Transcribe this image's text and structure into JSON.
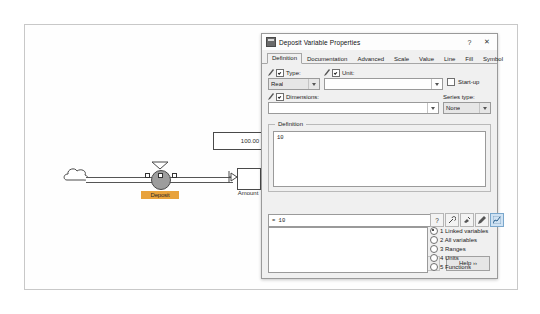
{
  "diagram": {
    "source_icon": "cloud-icon",
    "flow_label": "Deposit",
    "stock_label": "Amount",
    "readout_value": "100.00"
  },
  "dialog": {
    "title": "Deposit Variable Properties",
    "titlebar": {
      "help_label": "?",
      "close_label": "✕"
    },
    "tabs": [
      {
        "label": "Definition",
        "active": true
      },
      {
        "label": "Documentation",
        "active": false
      },
      {
        "label": "Advanced",
        "active": false
      },
      {
        "label": "Scale",
        "active": false
      },
      {
        "label": "Value",
        "active": false
      },
      {
        "label": "Line",
        "active": false
      },
      {
        "label": "Fill",
        "active": false
      },
      {
        "label": "Symbol",
        "active": false
      }
    ],
    "type": {
      "label": "Type:",
      "value": "Real",
      "checked": true
    },
    "unit": {
      "label": "Unit:",
      "value": "",
      "checked": true
    },
    "dimensions": {
      "label": "Dimensions:",
      "value": "",
      "checked": true
    },
    "startup": {
      "label": "Start-up",
      "checked": false
    },
    "series_type": {
      "label": "Series type:",
      "value": "None"
    },
    "definition": {
      "group_label": "Definition",
      "text": "10"
    },
    "status": {
      "value": "= 10"
    },
    "toolbar_icons": [
      "question-icon",
      "wrench-icon",
      "paint-icon",
      "pencil-icon",
      "graph-icon"
    ],
    "browser_options": [
      {
        "label": "1 Linked variables",
        "selected": true
      },
      {
        "label": "2 All variables",
        "selected": false
      },
      {
        "label": "3 Ranges",
        "selected": false
      },
      {
        "label": "4 Units",
        "selected": false
      },
      {
        "label": "5 Functions",
        "selected": false
      }
    ],
    "buttons": {
      "ok": "OK",
      "cancel": "Cancel",
      "apply": "Apply",
      "help": "Help ››"
    }
  }
}
